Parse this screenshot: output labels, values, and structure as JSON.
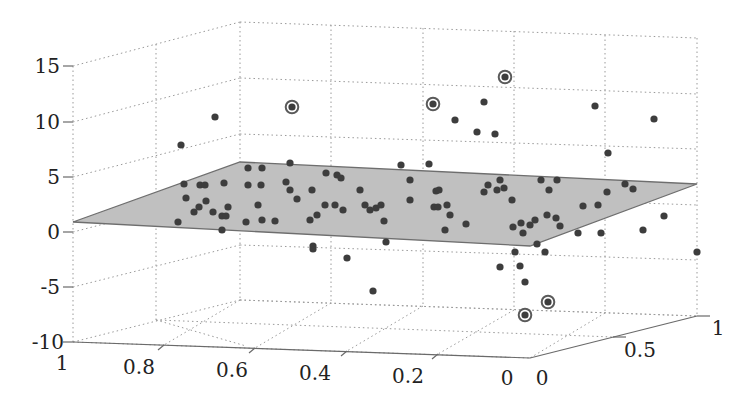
{
  "chart_data": {
    "type": "scatter3d",
    "title": "",
    "axes": {
      "x": {
        "label": "",
        "ticks": [
          "1",
          "0.8",
          "0.6",
          "0.4",
          "0.2",
          "0"
        ],
        "range": [
          0,
          1
        ],
        "reversed": true
      },
      "y": {
        "label": "",
        "ticks": [
          "0",
          "0.5",
          "1"
        ],
        "range": [
          0,
          1
        ]
      },
      "z": {
        "label": "",
        "ticks": [
          "15",
          "10",
          "5",
          "0",
          "-5",
          "-10"
        ],
        "range": [
          -10,
          15
        ]
      }
    },
    "grid": true,
    "grid_style": "dotted",
    "plane": {
      "color": "#c0c0c0",
      "edge_color": "#6e6e6e",
      "z_approx": [
        0,
        4
      ]
    },
    "point_color": "#3d3d3d",
    "outlier_ring_color": "#5a5a5a",
    "points_screen": [
      [
        181,
        145
      ],
      [
        215,
        117
      ],
      [
        184,
        184
      ],
      [
        200,
        185
      ],
      [
        205,
        185
      ],
      [
        224,
        183
      ],
      [
        186,
        198
      ],
      [
        206,
        201
      ],
      [
        199,
        207
      ],
      [
        213,
        212
      ],
      [
        178,
        222
      ],
      [
        194,
        212
      ],
      [
        228,
        207
      ],
      [
        222,
        216
      ],
      [
        226,
        216
      ],
      [
        222,
        230
      ],
      [
        248,
        168
      ],
      [
        262,
        168
      ],
      [
        248,
        185
      ],
      [
        261,
        185
      ],
      [
        258,
        205
      ],
      [
        262,
        220
      ],
      [
        246,
        222
      ],
      [
        275,
        221
      ],
      [
        290,
        163
      ],
      [
        286,
        182
      ],
      [
        290,
        190
      ],
      [
        297,
        199
      ],
      [
        312,
        190
      ],
      [
        310,
        220
      ],
      [
        317,
        215
      ],
      [
        313,
        246
      ],
      [
        313,
        249
      ],
      [
        326,
        173
      ],
      [
        337,
        175
      ],
      [
        341,
        178
      ],
      [
        325,
        205
      ],
      [
        335,
        205
      ],
      [
        343,
        210
      ],
      [
        360,
        190
      ],
      [
        365,
        205
      ],
      [
        370,
        210
      ],
      [
        376,
        208
      ],
      [
        381,
        205
      ],
      [
        384,
        221
      ],
      [
        347,
        258
      ],
      [
        386,
        242
      ],
      [
        401,
        165
      ],
      [
        410,
        180
      ],
      [
        410,
        200
      ],
      [
        429,
        164
      ],
      [
        436,
        191
      ],
      [
        439,
        190
      ],
      [
        434,
        207
      ],
      [
        438,
        207
      ],
      [
        447,
        205
      ],
      [
        450,
        215
      ],
      [
        445,
        230
      ],
      [
        466,
        224
      ],
      [
        484,
        192
      ],
      [
        488,
        185
      ],
      [
        497,
        190
      ],
      [
        504,
        188
      ],
      [
        512,
        200
      ],
      [
        521,
        223
      ],
      [
        523,
        233
      ],
      [
        530,
        225
      ],
      [
        535,
        220
      ],
      [
        541,
        180
      ],
      [
        549,
        190
      ],
      [
        557,
        180
      ],
      [
        547,
        215
      ],
      [
        556,
        218
      ],
      [
        560,
        226
      ],
      [
        583,
        206
      ],
      [
        598,
        205
      ],
      [
        607,
        192
      ],
      [
        625,
        184
      ],
      [
        633,
        189
      ],
      [
        643,
        230
      ],
      [
        664,
        216
      ],
      [
        654,
        119
      ],
      [
        595,
        106
      ],
      [
        608,
        153
      ],
      [
        578,
        233
      ],
      [
        601,
        233
      ],
      [
        537,
        244
      ],
      [
        545,
        252
      ],
      [
        515,
        252
      ],
      [
        520,
        266
      ],
      [
        500,
        267
      ],
      [
        455,
        120
      ],
      [
        484,
        102
      ],
      [
        477,
        132
      ],
      [
        495,
        134
      ],
      [
        500,
        180
      ],
      [
        513,
        227
      ],
      [
        697,
        252
      ],
      [
        373,
        291
      ],
      [
        525,
        282
      ]
    ],
    "outliers_screen": [
      [
        292,
        107
      ],
      [
        433,
        104
      ],
      [
        505,
        77
      ],
      [
        548,
        302
      ],
      [
        525,
        315
      ]
    ]
  }
}
